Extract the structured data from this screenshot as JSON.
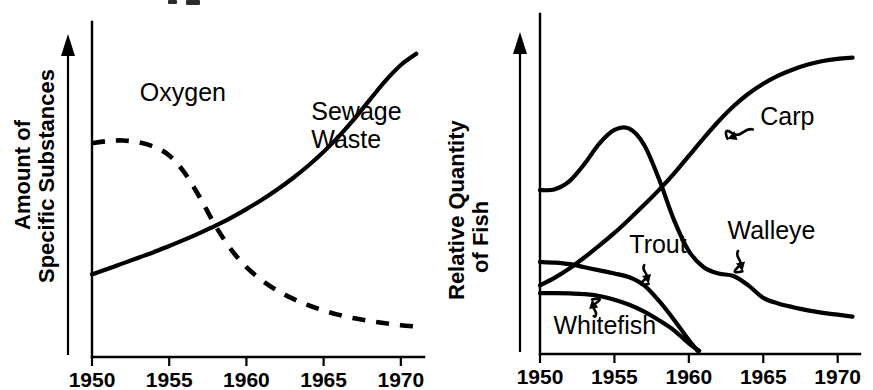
{
  "figure": {
    "panel_count": 2,
    "background_color": "#ffffff",
    "ink_color": "#000000"
  },
  "chart_data": [
    {
      "panel": "left",
      "type": "line",
      "title": "",
      "xlabel": "",
      "ylabel": "Amount of Specific Substances",
      "ylabel_lines": [
        "Amount of",
        "Specific Substances"
      ],
      "xlim": [
        1950,
        1971.5
      ],
      "ylim": [
        0,
        100
      ],
      "xticks": [
        1950,
        1955,
        1960,
        1965,
        1970
      ],
      "xtick_labels": [
        "1950",
        "1955",
        "1960",
        "1965",
        "1970"
      ],
      "yticks": [],
      "ytick_labels": [],
      "grid": false,
      "legend_position": "inline-annotations",
      "y_axis_arrow": true,
      "series": [
        {
          "name": "Oxygen",
          "style": "dashed",
          "label": "Oxygen",
          "label_x": 1953.1,
          "label_y": 82,
          "x": [
            1950,
            1951,
            1952,
            1953,
            1954,
            1955,
            1956,
            1957,
            1958,
            1959,
            1960,
            1961,
            1962,
            1963,
            1964,
            1965,
            1966,
            1967,
            1968,
            1969,
            1970,
            1971
          ],
          "values": [
            68.5,
            69.2,
            69.4,
            68.8,
            67.4,
            64.6,
            59.0,
            51.0,
            42.0,
            34.5,
            28.8,
            24.6,
            21.3,
            18.7,
            16.6,
            14.9,
            13.5,
            12.4,
            11.5,
            10.8,
            10.2,
            9.8
          ]
        },
        {
          "name": "Sewage Waste",
          "style": "solid",
          "label": "Sewage Waste",
          "label_lines": [
            "Sewage",
            "Waste"
          ],
          "label_x": 1964.2,
          "label_y": 76,
          "x": [
            1950,
            1951,
            1952,
            1953,
            1954,
            1955,
            1956,
            1957,
            1958,
            1959,
            1960,
            1961,
            1962,
            1963,
            1964,
            1965,
            1966,
            1967,
            1968,
            1969,
            1970,
            1971
          ],
          "values": [
            26.5,
            28.2,
            30.0,
            31.8,
            33.6,
            35.6,
            37.6,
            39.8,
            42.1,
            44.6,
            47.4,
            50.4,
            53.7,
            57.3,
            61.3,
            65.8,
            70.8,
            76.4,
            82.5,
            88.5,
            93.6,
            97.2
          ]
        }
      ]
    },
    {
      "panel": "right",
      "type": "line",
      "title": "",
      "xlabel": "",
      "ylabel": "Relative Quantity of Fish",
      "ylabel_lines": [
        "Relative Quantity",
        "of Fish"
      ],
      "xlim": [
        1950,
        1971.5
      ],
      "ylim": [
        0,
        100
      ],
      "xticks": [
        1950,
        1955,
        1960,
        1965,
        1970
      ],
      "xtick_labels": [
        "1950",
        "1955",
        "1960",
        "1965",
        "1970"
      ],
      "yticks": [],
      "ytick_labels": [],
      "grid": false,
      "legend_position": "inline-annotations",
      "y_axis_arrow": true,
      "series": [
        {
          "name": "Carp",
          "style": "solid",
          "label": "Carp",
          "label_x": 1964.8,
          "label_y": 73.5,
          "leader": {
            "from_x": 1964.3,
            "from_y": 72.0,
            "to_x": 1962.6,
            "to_y": 69.0
          },
          "x": [
            1950,
            1951,
            1952,
            1953,
            1954,
            1955,
            1956,
            1957,
            1958,
            1959,
            1960,
            1961,
            1962,
            1963,
            1964,
            1965,
            1966,
            1967,
            1968,
            1969,
            1970,
            1971
          ],
          "values": [
            22.0,
            24.5,
            27.5,
            31.0,
            34.8,
            38.8,
            43.2,
            47.8,
            52.6,
            57.8,
            63.5,
            69.2,
            74.6,
            79.4,
            83.4,
            86.6,
            89.2,
            91.2,
            92.8,
            93.9,
            94.6,
            95.0
          ]
        },
        {
          "name": "Walleye",
          "style": "solid",
          "label": "Walleye",
          "label_x": 1962.6,
          "label_y": 37.0,
          "leader": {
            "from_x": 1963.3,
            "from_y": 33.0,
            "to_x": 1963.6,
            "to_y": 26.5
          },
          "x": [
            1950,
            1951,
            1952,
            1953,
            1954,
            1955,
            1956,
            1957,
            1958,
            1959,
            1960,
            1961,
            1962,
            1963,
            1964,
            1965,
            1966,
            1967,
            1968,
            1969,
            1970,
            1971
          ],
          "values": [
            52.5,
            52.8,
            55.5,
            61.0,
            67.5,
            71.8,
            72.2,
            67.0,
            56.0,
            43.0,
            33.0,
            27.8,
            25.8,
            25.0,
            22.0,
            18.0,
            16.2,
            15.0,
            14.0,
            13.2,
            12.6,
            12.0
          ]
        },
        {
          "name": "Trout",
          "style": "solid",
          "label": "Trout",
          "label_x": 1956.0,
          "label_y": 32.5,
          "leader": {
            "from_x": 1957.0,
            "from_y": 28.5,
            "to_x": 1957.3,
            "to_y": 22.5
          },
          "x": [
            1950,
            1951,
            1952,
            1953,
            1954,
            1955,
            1956,
            1957,
            1958,
            1959,
            1960,
            1960.6
          ],
          "values": [
            29.5,
            29.3,
            28.8,
            27.8,
            26.8,
            25.8,
            24.6,
            22.0,
            17.0,
            11.0,
            4.5,
            1.0
          ]
        },
        {
          "name": "Whitefish",
          "style": "solid",
          "label": "Whitefish",
          "label_x": 1950.9,
          "label_y": 6.5,
          "leader": {
            "from_x": 1953.7,
            "from_y": 12.0,
            "to_x": 1953.5,
            "to_y": 17.5
          },
          "x": [
            1950,
            1951,
            1952,
            1953,
            1954,
            1955,
            1956,
            1957,
            1958,
            1959,
            1960,
            1960.7
          ],
          "values": [
            19.5,
            19.5,
            19.4,
            19.2,
            18.6,
            17.4,
            15.8,
            13.6,
            10.8,
            7.6,
            3.4,
            1.0
          ]
        }
      ]
    }
  ]
}
